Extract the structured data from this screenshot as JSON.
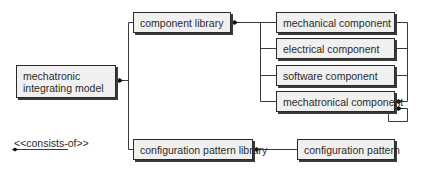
{
  "diagram": {
    "type": "composition-hierarchy",
    "nodes": {
      "root": {
        "label": "mechatronic integrating model"
      },
      "component_library": {
        "label": "component library"
      },
      "mechanical": {
        "label": "mechanical component"
      },
      "electrical": {
        "label": "electrical component"
      },
      "software": {
        "label": "software component"
      },
      "mechatronical": {
        "label": "mechatronical component"
      },
      "config_library": {
        "label": "configuration pattern library"
      },
      "config_pattern": {
        "label": "configuration pattern"
      }
    },
    "root_lines": [
      "mechatronic",
      "integrating model"
    ],
    "edges": [
      {
        "from": "root",
        "to": "component_library",
        "type": "consists-of"
      },
      {
        "from": "root",
        "to": "config_library",
        "type": "consists-of"
      },
      {
        "from": "component_library",
        "to": "mechanical",
        "type": "consists-of"
      },
      {
        "from": "component_library",
        "to": "electrical",
        "type": "consists-of"
      },
      {
        "from": "component_library",
        "to": "software",
        "type": "consists-of"
      },
      {
        "from": "component_library",
        "to": "mechatronical",
        "type": "consists-of"
      },
      {
        "from": "mechatronical",
        "to": "mechanical",
        "type": "consists-of"
      },
      {
        "from": "mechatronical",
        "to": "electrical",
        "type": "consists-of"
      },
      {
        "from": "mechatronical",
        "to": "software",
        "type": "consists-of"
      },
      {
        "from": "mechatronical",
        "to": "mechatronical",
        "type": "consists-of"
      },
      {
        "from": "config_library",
        "to": "config_pattern",
        "type": "consists-of"
      }
    ],
    "legend": {
      "label": "<<consists-of>>"
    }
  },
  "colors": {
    "box_fill": "#f0f0f0",
    "box_border": "#2a2a2a",
    "line": "#3a3a3a",
    "text": "#2b2b2b"
  }
}
